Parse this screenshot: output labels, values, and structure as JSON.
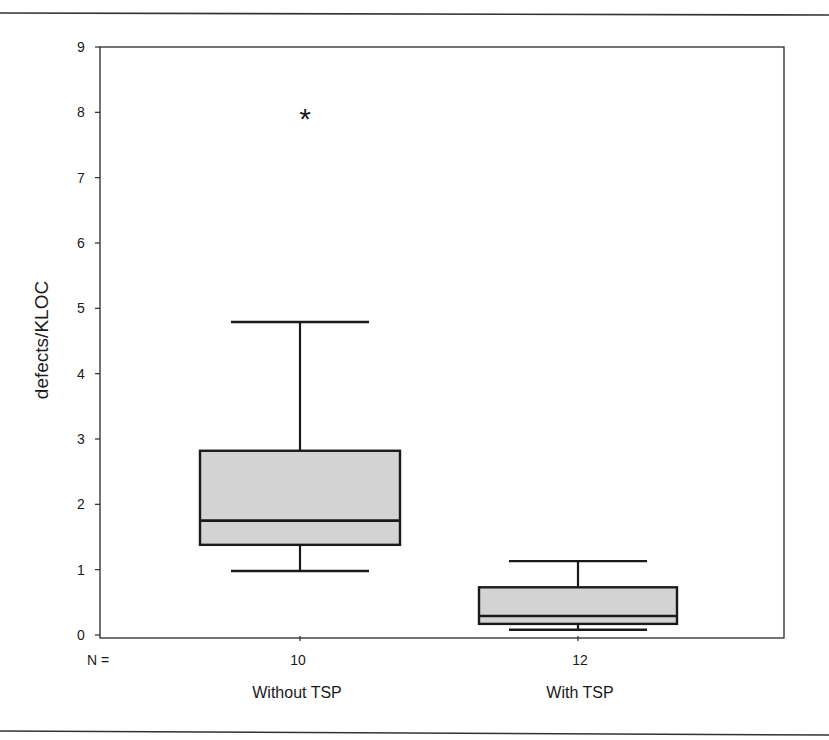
{
  "figure": {
    "rule_color": "#333333",
    "axis_color": "#2a2a2a",
    "box_fill": "#d3d3d3",
    "box_stroke": "#1a1a1a"
  },
  "chart_data": {
    "type": "box",
    "title": "",
    "xlabel": "",
    "ylabel": "defects/KLOC",
    "ylim": [
      0,
      9
    ],
    "yticks": [
      0,
      1,
      2,
      3,
      4,
      5,
      6,
      7,
      8,
      9
    ],
    "grid": false,
    "legend": null,
    "n_label": "N =",
    "categories": [
      "Without TSP",
      "With TSP"
    ],
    "series": [
      {
        "name": "Without TSP",
        "n": 10,
        "whisker_low": 0.98,
        "q1": 1.38,
        "median": 1.75,
        "q3": 2.82,
        "whisker_high": 4.79,
        "outliers": [],
        "extremes": [
          7.96
        ],
        "extreme_marker": "*"
      },
      {
        "name": "With TSP",
        "n": 12,
        "whisker_low": 0.08,
        "q1": 0.17,
        "median": 0.29,
        "q3": 0.73,
        "whisker_high": 1.13,
        "outliers": [],
        "extremes": []
      }
    ]
  }
}
